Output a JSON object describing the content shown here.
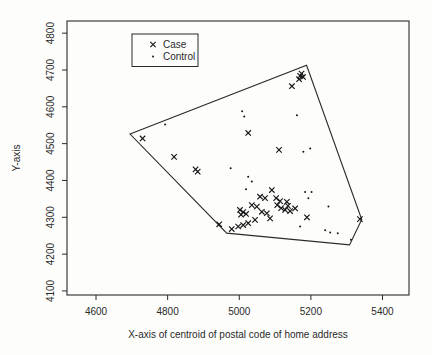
{
  "figure": {
    "background": "#fdfdfc",
    "ink_color": "#2a2a2a",
    "marker_color": "#161616"
  },
  "chart_data": {
    "type": "scatter",
    "title": "",
    "xlabel": "X-axis of centroid of postal code of home address",
    "ylabel": "Y-axis",
    "xlim": [
      4519,
      5474
    ],
    "ylim": [
      4089,
      4833
    ],
    "xticks": [
      4600,
      4800,
      5000,
      5200,
      5400
    ],
    "yticks": [
      4100,
      4200,
      4300,
      4400,
      4500,
      4600,
      4700,
      4800
    ],
    "grid": false,
    "legend": {
      "position": "top-center-left",
      "entries": [
        {
          "label": "Case",
          "marker": "x"
        },
        {
          "label": "Control",
          "marker": "dot"
        }
      ]
    },
    "hull_polygon": [
      [
        4695,
        4526
      ],
      [
        5188,
        4713
      ],
      [
        5342,
        4294
      ],
      [
        5308,
        4225
      ],
      [
        4965,
        4257
      ]
    ],
    "series": [
      {
        "name": "Case",
        "marker": "x",
        "points": [
          [
            4730,
            4514
          ],
          [
            4818,
            4464
          ],
          [
            4878,
            4430
          ],
          [
            4884,
            4424
          ],
          [
            5025,
            4529
          ],
          [
            5111,
            4483
          ],
          [
            5147,
            4656
          ],
          [
            5170,
            4684
          ],
          [
            5178,
            4681
          ],
          [
            5167,
            4675
          ],
          [
            5174,
            4690
          ],
          [
            5091,
            4374
          ],
          [
            5058,
            4356
          ],
          [
            5072,
            4352
          ],
          [
            5103,
            4352
          ],
          [
            5114,
            4344
          ],
          [
            5133,
            4342
          ],
          [
            5035,
            4333
          ],
          [
            5049,
            4329
          ],
          [
            5106,
            4333
          ],
          [
            5117,
            4325
          ],
          [
            5128,
            4320
          ],
          [
            5136,
            4331
          ],
          [
            5142,
            4317
          ],
          [
            5156,
            4324
          ],
          [
            5002,
            4320
          ],
          [
            5011,
            4314
          ],
          [
            5019,
            4309
          ],
          [
            5005,
            4307
          ],
          [
            5063,
            4315
          ],
          [
            5077,
            4311
          ],
          [
            5086,
            4297
          ],
          [
            5044,
            4293
          ],
          [
            5025,
            4284
          ],
          [
            5011,
            4279
          ],
          [
            4997,
            4275
          ],
          [
            4944,
            4281
          ],
          [
            4979,
            4268
          ],
          [
            5189,
            4300
          ],
          [
            5337,
            4295
          ]
        ]
      },
      {
        "name": "Control",
        "marker": "dot",
        "points": [
          [
            4793,
            4552
          ],
          [
            5008,
            4588
          ],
          [
            5014,
            4574
          ],
          [
            5161,
            4577
          ],
          [
            4976,
            4433
          ],
          [
            5025,
            4410
          ],
          [
            5035,
            4397
          ],
          [
            5019,
            4376
          ],
          [
            5179,
            4478
          ],
          [
            5198,
            4487
          ],
          [
            5184,
            4369
          ],
          [
            5202,
            4369
          ],
          [
            5193,
            4352
          ],
          [
            5249,
            4329
          ],
          [
            5170,
            4275
          ],
          [
            5240,
            4265
          ],
          [
            5254,
            4259
          ],
          [
            5275,
            4257
          ],
          [
            5312,
            4239
          ]
        ]
      }
    ]
  }
}
